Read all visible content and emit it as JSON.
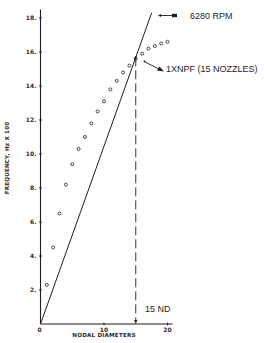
{
  "chart_data": {
    "type": "scatter",
    "title": "",
    "xlabel": "NODAL DIAMETERS",
    "ylabel": "FREQUENCY, Hz X 100",
    "xlim": [
      0,
      20
    ],
    "ylim": [
      0,
      18.5
    ],
    "grid": false,
    "legend": null,
    "x_ticks": [
      {
        "value": 0,
        "label": "0"
      },
      {
        "value": 10,
        "label": "10"
      },
      {
        "value": 20,
        "label": "20"
      }
    ],
    "y_ticks": [
      {
        "value": 2,
        "label": "2."
      },
      {
        "value": 4,
        "label": "4."
      },
      {
        "value": 6,
        "label": "6."
      },
      {
        "value": 8,
        "label": "8."
      },
      {
        "value": 10,
        "label": "10."
      },
      {
        "value": 12,
        "label": "12."
      },
      {
        "value": 14,
        "label": "14."
      },
      {
        "value": 16,
        "label": "16."
      },
      {
        "value": 18,
        "label": "18."
      }
    ],
    "series": [
      {
        "name": "Blade natural frequencies",
        "type": "scatter",
        "marker": "open-circle",
        "x": [
          1,
          2,
          3,
          4,
          5,
          6,
          7,
          8,
          9,
          10,
          11,
          12,
          13,
          14,
          15,
          16,
          17,
          18,
          19,
          20
        ],
        "y": [
          2.3,
          4.5,
          6.5,
          8.2,
          9.4,
          10.3,
          11.0,
          11.8,
          12.5,
          13.1,
          13.8,
          14.3,
          14.8,
          15.2,
          15.6,
          15.9,
          16.2,
          16.35,
          16.5,
          16.6
        ]
      },
      {
        "name": "6280 RPM excitation line",
        "type": "line",
        "x": [
          0,
          17.5
        ],
        "y": [
          0,
          18.3
        ]
      }
    ],
    "annotations": [
      {
        "text": "6280 RPM",
        "target": "excitation line top",
        "arrow": true
      },
      {
        "text": "1XNPF (15 NOZZLES)",
        "target": "intersection at 15 ND",
        "arrow": true
      },
      {
        "text": "15 ND",
        "target": "dashed vertical line at x=15",
        "x": 15
      }
    ]
  },
  "labels": {
    "rpm": "6280 RPM",
    "npf": "1XNPF (15 NOZZLES)",
    "nd": "15 ND",
    "xlabel": "NODAL DIAMETERS",
    "ylabel": "FREQUENCY, Hz X 100"
  },
  "layout": {
    "origin_px": [
      40.5,
      324
    ],
    "x_px_per_unit": 6.35,
    "y_px_per_unit": 17,
    "ink_color": "#1e1e1e"
  }
}
